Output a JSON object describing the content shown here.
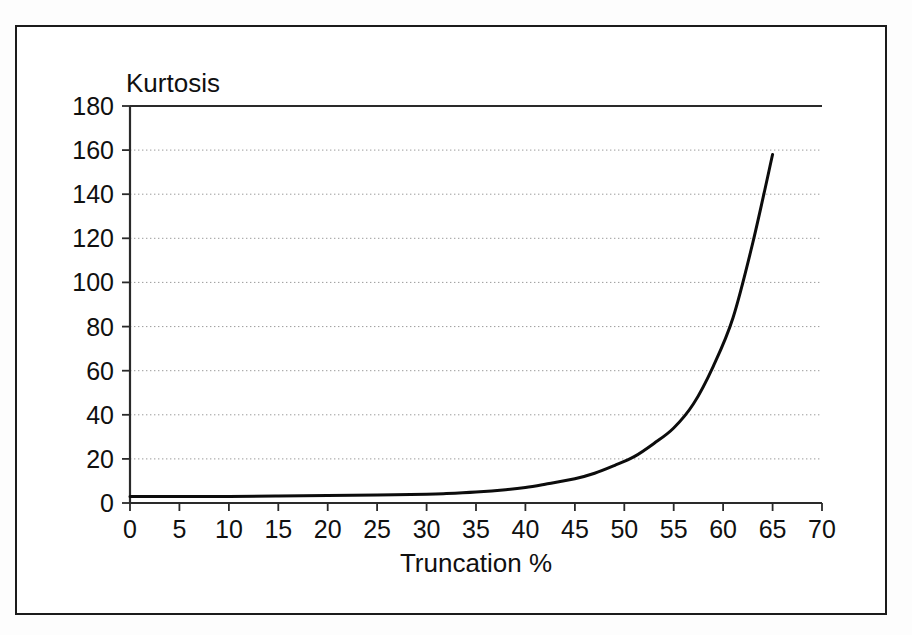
{
  "figure": {
    "frame_color": "#1b1b1b",
    "background": "#ffffff"
  },
  "chart_data": {
    "type": "line",
    "title": "",
    "ylabel": "Kurtosis",
    "xlabel": "Truncation %",
    "xlim": [
      0,
      70
    ],
    "ylim": [
      0,
      180
    ],
    "xticks": [
      0,
      5,
      10,
      15,
      20,
      25,
      30,
      35,
      40,
      45,
      50,
      55,
      60,
      65,
      70
    ],
    "yticks": [
      0,
      20,
      40,
      60,
      80,
      100,
      120,
      140,
      160,
      180
    ],
    "xtick_labels": [
      "0",
      "5",
      "10",
      "15",
      "20",
      "25",
      "30",
      "35",
      "40",
      "45",
      "50",
      "55",
      "60",
      "65",
      "70"
    ],
    "ytick_labels": [
      "0",
      "20",
      "40",
      "60",
      "80",
      "100",
      "120",
      "140",
      "160",
      "180"
    ],
    "grid": "horizontal-dotted",
    "legend": "none",
    "series": [
      {
        "name": "Kurtosis",
        "color": "#0c0c0c",
        "x": [
          0,
          5,
          10,
          15,
          20,
          25,
          30,
          32,
          35,
          38,
          40,
          42,
          45,
          47,
          49,
          51,
          53,
          55,
          57,
          59,
          61,
          63,
          65
        ],
        "values": [
          3,
          3,
          3,
          3.2,
          3.4,
          3.6,
          4,
          4.3,
          5,
          6,
          7,
          8.5,
          11,
          13.5,
          17,
          21,
          27,
          34,
          45,
          62,
          84,
          118,
          158
        ]
      }
    ],
    "annotations": []
  },
  "axes": {
    "y_axis_title": "Kurtosis",
    "x_axis_title": "Truncation %"
  }
}
